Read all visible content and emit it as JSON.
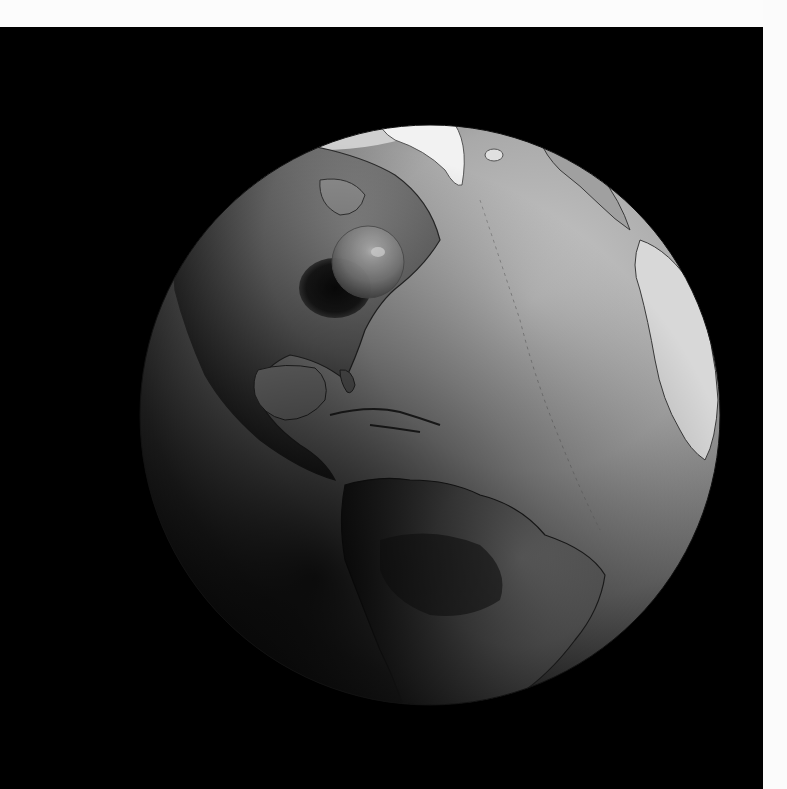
{
  "image": {
    "subject": "Earth globe (Americas hemisphere) with a small sphere representing all of Earth's water",
    "style": "grayscale 3D render",
    "background_color": "#000000",
    "margin_color": "#fcfcfc"
  },
  "globe": {
    "center_x": 430,
    "center_y": 415,
    "radius": 290,
    "lit_side": "upper-right",
    "visible_regions": [
      "Greenland",
      "Arctic Canada",
      "North America",
      "Gulf of Mexico",
      "Caribbean",
      "Central America",
      "South America",
      "Atlantic Ocean",
      "West Africa coast"
    ]
  },
  "water_sphere": {
    "center_x": 368,
    "center_y": 262,
    "radius": 36,
    "location_label": "over eastern North America",
    "shadow_center_x": 335,
    "shadow_center_y": 288
  }
}
